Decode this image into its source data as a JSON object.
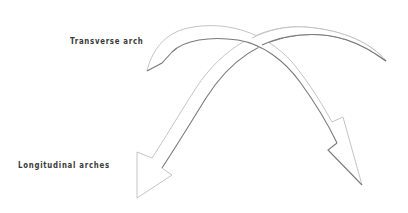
{
  "diagram": {
    "labels": {
      "transverse": "Transverse arch",
      "longitudinal": "Longitudinal arches"
    },
    "elements": [
      {
        "name": "transverse-arch-arrow",
        "direction": "upper-left tail to lower-right arrowhead"
      },
      {
        "name": "longitudinal-arch-arrow",
        "direction": "upper-right tail to lower-left arrowhead"
      }
    ],
    "colors": {
      "background": "#ffffff",
      "outline_light": "#bdbdbd",
      "outline_dark": "#7a7a7a",
      "text": "#3a3a3a"
    }
  }
}
